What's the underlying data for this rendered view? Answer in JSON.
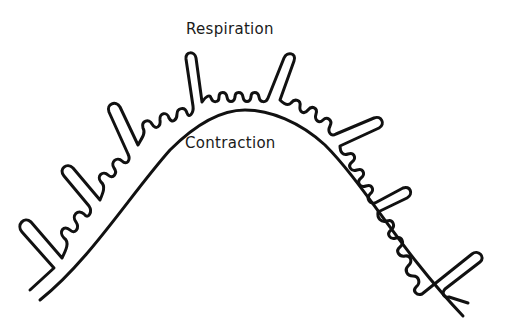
{
  "diagram": {
    "labels": {
      "top": "Respiration",
      "inner": "Contraction"
    },
    "elements": {
      "inner_curve": "smooth arch representing the contraction surface",
      "outer_membrane": "wavy folded membrane with small folds and long finger-like projections",
      "long_projections_count": 6
    },
    "colors": {
      "stroke": "#111111",
      "background": "#ffffff",
      "text": "#1a1a1a"
    }
  }
}
